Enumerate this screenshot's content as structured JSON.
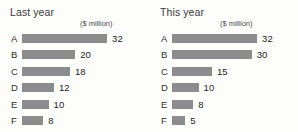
{
  "chart_data": [
    {
      "type": "bar",
      "title": "Last year",
      "unit_label": "($ million)",
      "xlabel": "",
      "ylabel": "",
      "orientation": "horizontal",
      "grid": false,
      "legend": "none",
      "xlim": [
        0,
        32
      ],
      "categories": [
        "A",
        "B",
        "C",
        "D",
        "E",
        "F"
      ],
      "values": [
        32,
        20,
        18,
        12,
        10,
        8
      ],
      "value_labels": [
        "32",
        "20",
        "18",
        "12",
        "10",
        "8"
      ],
      "bar_color": "#8c8c8c"
    },
    {
      "type": "bar",
      "title": "This year",
      "unit_label": "($ million)",
      "xlabel": "",
      "ylabel": "",
      "orientation": "horizontal",
      "grid": false,
      "legend": "none",
      "xlim": [
        0,
        32
      ],
      "categories": [
        "A",
        "B",
        "C",
        "D",
        "E",
        "F"
      ],
      "values": [
        32,
        30,
        15,
        10,
        8,
        5
      ],
      "value_labels": [
        "32",
        "30",
        "15",
        "10",
        "8",
        "5"
      ],
      "bar_color": "#8c8c8c"
    }
  ],
  "scale": {
    "px_per_unit": 2.66,
    "max_value": 32
  }
}
